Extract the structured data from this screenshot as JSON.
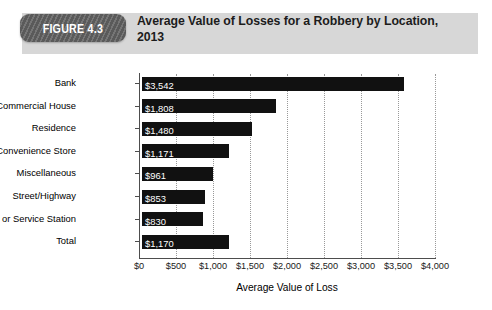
{
  "figure": {
    "badge_label": "FIGURE 4.3",
    "title": "Average Value of Losses for a Robbery by Location, 2013",
    "band_color": "#d7d7d7",
    "badge_color": "#5a5a5a"
  },
  "chart_data": {
    "type": "bar",
    "orientation": "horizontal",
    "title": "Average Value of Losses for a Robbery by Location, 2013",
    "xlabel": "Average Value of Loss",
    "ylabel": "",
    "xlim": [
      0,
      4000
    ],
    "grid": true,
    "legend": null,
    "bar_color": "#111111",
    "categories": [
      "Bank",
      "Commercial House",
      "Residence",
      "Convenience Store",
      "Miscellaneous",
      "Street/Highway",
      "Gas or Service Station",
      "Total"
    ],
    "values": [
      3542,
      1808,
      1480,
      1171,
      961,
      853,
      830,
      1170
    ],
    "value_labels": [
      "$3,542",
      "$1,808",
      "$1,480",
      "$1,171",
      "$961",
      "$853",
      "$830",
      "$1,170"
    ],
    "xticks": [
      0,
      500,
      1000,
      1500,
      2000,
      2500,
      3000,
      3500,
      4000
    ],
    "xtick_labels": [
      "$0",
      "$500",
      "$1,000",
      "$1,500",
      "$2,000",
      "$2,500",
      "$3,000",
      "$3,500",
      "$4,000"
    ]
  }
}
